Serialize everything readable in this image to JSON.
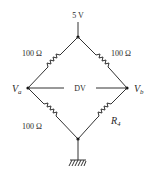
{
  "diagram": {
    "type": "wheatstone-bridge",
    "supply": {
      "label": "5 V"
    },
    "resistors": {
      "top_left": {
        "label": "100 Ω"
      },
      "top_right": {
        "label": "100 Ω"
      },
      "bottom_left": {
        "label": "100 Ω"
      },
      "bottom_right": {
        "label": "R",
        "subscript": "4"
      }
    },
    "nodes": {
      "left": {
        "label": "V",
        "subscript": "a"
      },
      "right": {
        "label": "V",
        "subscript": "b"
      }
    },
    "differential": {
      "label": "DV"
    },
    "ground": {
      "symbol": "ground"
    },
    "colors": {
      "ink": "#2a2a2a",
      "background": "#ffffff"
    }
  }
}
